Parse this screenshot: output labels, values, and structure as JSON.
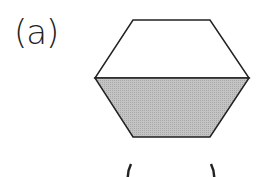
{
  "question": {
    "label": "(a)",
    "answer_blank": "(      )"
  },
  "figure": {
    "shape": "hexagon",
    "shaded_part": "bottom half",
    "fraction_shaded": "1/2",
    "colors": {
      "stroke": "#222222",
      "shade": "#bdbdbd",
      "fill": "#ffffff"
    }
  }
}
